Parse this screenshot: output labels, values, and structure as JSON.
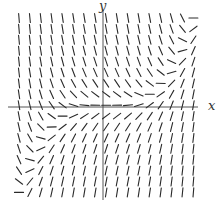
{
  "figure": {
    "type": "slope-field",
    "x_axis_label": "x",
    "y_axis_label": "y",
    "colors": {
      "segment": "#2a2a2a",
      "axis": "#555555",
      "background": "#ffffff"
    }
  },
  "layout": {
    "grid_cols": 17,
    "grid_rows": 17,
    "x0_px": 19,
    "y0_px": 18,
    "step_px": 10.9,
    "segment_len_px": 9,
    "axis_x_px": 103,
    "axis_y_px": 107,
    "axis_h_from_px": 8,
    "axis_h_to_px": 198,
    "axis_v_from_px": 10,
    "axis_v_to_px": 200
  },
  "slope_model": {
    "description": "Null-slope curve runs from lower-left through origin to upper-right; slopes negative/steep in upper-left, positive/steep in lower-right",
    "domain_x": [
      -2,
      2
    ],
    "domain_y": [
      -2,
      2
    ],
    "step": 0.25,
    "gain": 3.0,
    "curve_exponent": 3
  }
}
